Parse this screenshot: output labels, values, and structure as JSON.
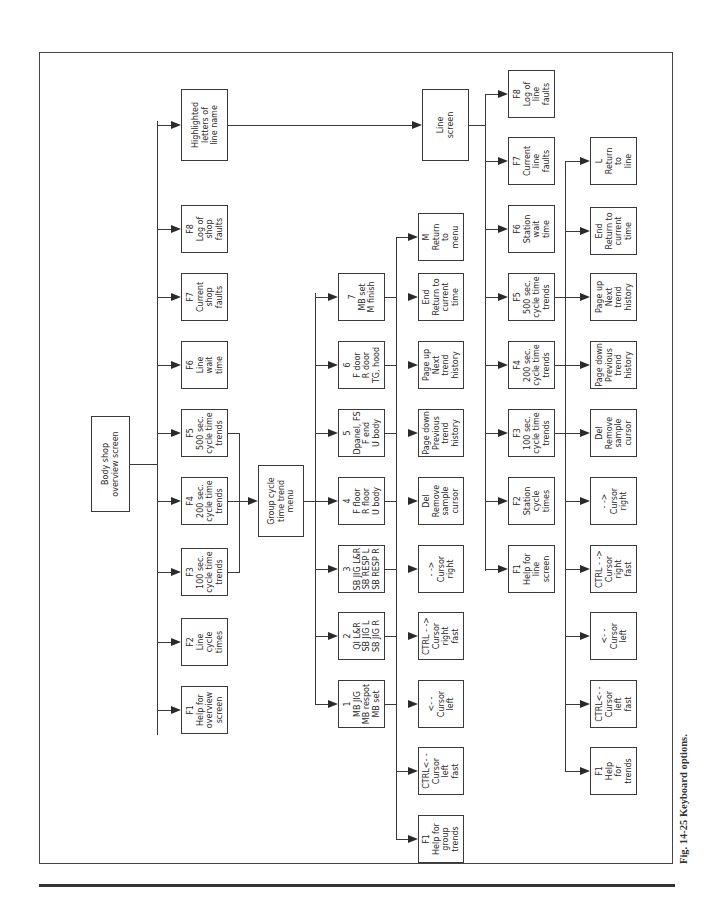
{
  "caption": "Fig. 14-25 Keyboard options.",
  "root": {
    "label": "Body shop\noverview screen"
  },
  "overview_keys": [
    {
      "label": "F1\nHelp for\noverview\nscreen"
    },
    {
      "label": "F2\nLine\ncycle\ntimes"
    },
    {
      "label": "F3\n100 sec.\ncycle time\ntrends"
    },
    {
      "label": "F4\n200 sec.\ncycle time\ntrends"
    },
    {
      "label": "F5\n500 sec.\ncycle time\ntrends"
    },
    {
      "label": "F6\nLine\nwait\ntime"
    },
    {
      "label": "F7\nCurrent\nshop\nfaults"
    },
    {
      "label": "F8\nLog of\nshop\nfaults"
    },
    {
      "label": "Highlighted\nletters of\nline name"
    }
  ],
  "group_menu": {
    "label": "Group cycle\ntime trend\nmenu"
  },
  "groups": [
    {
      "label": "1\nMB JIG\nMB respot\nMB set"
    },
    {
      "label": "2\nQI L&R\nSB JIG L\nSB JIG R"
    },
    {
      "label": "3\nSB JIG L&R\nSB RESP L\nSB RESP R"
    },
    {
      "label": "4\nF floor\nR floor\nU body"
    },
    {
      "label": "5\nDpanel, FS\nF end\nU body"
    },
    {
      "label": "6\nF door\nR door\nTG, hood"
    },
    {
      "label": "7\nMB set\nM finish"
    }
  ],
  "group_trend_keys": [
    {
      "label": "F1\nHelp for\ngroup\ntrends"
    },
    {
      "label": "CTRL<- -\nCursor\nleft\nfast"
    },
    {
      "label": "<- -\nCursor\nleft"
    },
    {
      "label": "CTRL - ->\nCursor\nright\nfast"
    },
    {
      "label": "- ->\nCursor\nright"
    },
    {
      "label": "Del\nRemove\nsample\ncursor"
    },
    {
      "label": "Page down\nPrevious\ntrend\nhistory"
    },
    {
      "label": "Page up\nNext\ntrend\nhistory"
    },
    {
      "label": "End\nReturn to\ncurrent\ntime"
    },
    {
      "label": "M\nReturn\nto\nmenu"
    }
  ],
  "line_screen": {
    "label": "Line\nscreen"
  },
  "line_keys": [
    {
      "label": "F1\nHelp for\nline\nscreen"
    },
    {
      "label": "F2\nStation\ncycle\ntimes"
    },
    {
      "label": "F3\n100 sec.\ncycle time\ntrends"
    },
    {
      "label": "F4\n200 sec.\ncycle time\ntrends"
    },
    {
      "label": "F5\n500 sec.\ncycle time\ntrends"
    },
    {
      "label": "F6\nStation\nwait\ntime"
    },
    {
      "label": "F7\nCurrent\nline\nfaults"
    },
    {
      "label": "F8\nLog of\nline\nfaults"
    }
  ],
  "line_trend_keys": [
    {
      "label": "F1\nHelp\nfor\ntrends"
    },
    {
      "label": "CTRL<- -\nCursor\nleft\nfast"
    },
    {
      "label": "<- -\nCursor\nleft"
    },
    {
      "label": "CTRL - ->\nCursor\nright\nfast"
    },
    {
      "label": "- ->\nCursor\nright"
    },
    {
      "label": "Del\nRemove\nsample\ncursor"
    },
    {
      "label": "Page down\nPrevious\ntrend\nhistory"
    },
    {
      "label": "Page up\nNext\ntrend\nhistory"
    },
    {
      "label": "End\nReturn to\ncurrent\ntime"
    },
    {
      "label": "L\nReturn\nto\nline"
    }
  ]
}
